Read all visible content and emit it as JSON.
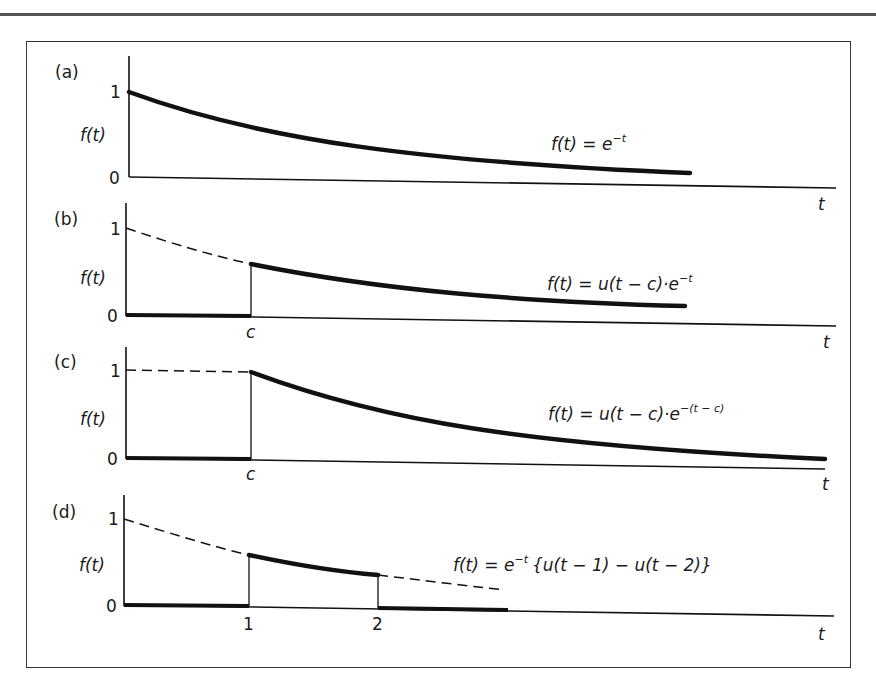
{
  "figure": {
    "panels": [
      {
        "id": "a",
        "label": "(a)",
        "y_label": "f(t)",
        "y_ticks": [
          "1",
          "0"
        ],
        "x_label": "t",
        "x_ticks": [],
        "equation": "f(t) = e",
        "equation_sup": "−t",
        "equation_tail": ""
      },
      {
        "id": "b",
        "label": "(b)",
        "y_label": "f(t)",
        "y_ticks": [
          "1",
          "0"
        ],
        "x_label": "t",
        "x_ticks": [
          "c"
        ],
        "equation": "f(t) = u(t − c)·e",
        "equation_sup": "−t",
        "equation_tail": ""
      },
      {
        "id": "c",
        "label": "(c)",
        "y_label": "f(t)",
        "y_ticks": [
          "1",
          "0"
        ],
        "x_label": "t",
        "x_ticks": [
          "c"
        ],
        "equation": "f(t) = u(t − c)·e",
        "equation_sup": "−(t − c)",
        "equation_tail": ""
      },
      {
        "id": "d",
        "label": "(d)",
        "y_label": "f(t)",
        "y_ticks": [
          "1",
          "0"
        ],
        "x_label": "t",
        "x_ticks": [
          "1",
          "2"
        ],
        "equation": "f(t) = e",
        "equation_sup": "−t",
        "equation_tail": "{u(t − 1) − u(t − 2)}"
      }
    ]
  }
}
